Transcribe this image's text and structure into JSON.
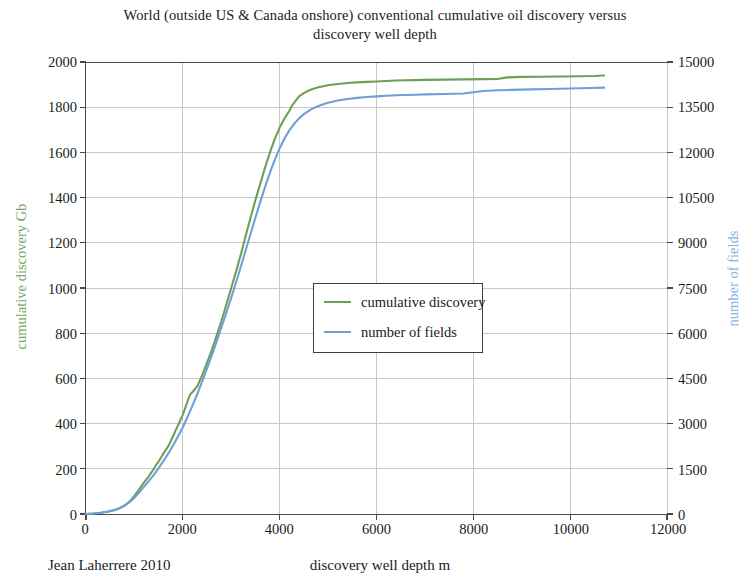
{
  "chart_data": {
    "type": "line",
    "title": "World (outside US & Canada onshore) conventional cumulative oil discovery versus discovery well depth",
    "title_line1": "World (outside US & Canada onshore) conventional cumulative oil discovery versus",
    "title_line2": "discovery well depth",
    "xlabel": "discovery well depth m",
    "ylabel": "cumulative discovery Gb",
    "ylabel_right": "number of fields",
    "credit": "Jean Laherrere 2010",
    "xlim": [
      0,
      12000
    ],
    "ylim": [
      0,
      2000
    ],
    "ylim_right": [
      0,
      15000
    ],
    "xticks": [
      0,
      2000,
      4000,
      6000,
      8000,
      10000,
      12000
    ],
    "yticks": [
      0,
      200,
      400,
      600,
      800,
      1000,
      1200,
      1400,
      1600,
      1800,
      2000
    ],
    "yticks_right": [
      0,
      1500,
      3000,
      4500,
      6000,
      7500,
      9000,
      10500,
      12000,
      13500,
      15000
    ],
    "grid": true,
    "legend_position": "center",
    "colors": {
      "cumulative_discovery": "#6f9e55",
      "number_of_fields": "#6f9fd8"
    },
    "series": [
      {
        "name": "cumulative discovery",
        "color": "#6f9e55",
        "axis": "left",
        "unit": "Gb",
        "x": [
          0,
          150,
          300,
          450,
          600,
          700,
          800,
          900,
          1000,
          1100,
          1200,
          1300,
          1400,
          1450,
          1500,
          1600,
          1650,
          1700,
          1800,
          1850,
          1900,
          2000,
          2100,
          2150,
          2200,
          2300,
          2400,
          2500,
          2600,
          2700,
          2800,
          2900,
          3000,
          3100,
          3200,
          3300,
          3400,
          3500,
          3600,
          3700,
          3800,
          3900,
          4000,
          4100,
          4200,
          4250,
          4300,
          4400,
          4500,
          4600,
          4700,
          4800,
          4900,
          5000,
          5200,
          5400,
          5600,
          5800,
          6000,
          6200,
          6400,
          6600,
          6800,
          7000,
          7400,
          7800,
          8200,
          8500,
          8700,
          9000,
          9400,
          9800,
          10200,
          10500,
          10700
        ],
        "y": [
          0,
          2,
          5,
          10,
          18,
          26,
          38,
          55,
          80,
          110,
          140,
          168,
          200,
          218,
          232,
          268,
          285,
          300,
          345,
          370,
          392,
          440,
          500,
          528,
          540,
          566,
          614,
          670,
          726,
          790,
          856,
          928,
          1000,
          1074,
          1150,
          1232,
          1312,
          1390,
          1462,
          1534,
          1600,
          1660,
          1710,
          1750,
          1784,
          1806,
          1820,
          1848,
          1862,
          1874,
          1882,
          1888,
          1893,
          1897,
          1903,
          1907,
          1910,
          1912,
          1914,
          1916,
          1918,
          1919,
          1920,
          1921,
          1922,
          1923,
          1924,
          1925,
          1932,
          1934,
          1935,
          1936,
          1937,
          1938,
          1940
        ]
      },
      {
        "name": "number of fields",
        "color": "#6f9fd8",
        "axis": "right",
        "unit": "fields",
        "x": [
          0,
          150,
          300,
          450,
          600,
          700,
          800,
          900,
          1000,
          1100,
          1200,
          1300,
          1400,
          1500,
          1600,
          1700,
          1800,
          1900,
          2000,
          2100,
          2200,
          2300,
          2400,
          2500,
          2600,
          2700,
          2800,
          2900,
          3000,
          3100,
          3200,
          3300,
          3400,
          3500,
          3600,
          3700,
          3800,
          3900,
          4000,
          4100,
          4200,
          4300,
          4400,
          4500,
          4600,
          4700,
          4800,
          4900,
          5000,
          5200,
          5400,
          5600,
          5800,
          6000,
          6200,
          6400,
          6600,
          6800,
          7000,
          7400,
          7800,
          8200,
          8500,
          8800,
          9200,
          9600,
          10000,
          10400,
          10700
        ],
        "y": [
          0,
          15,
          40,
          80,
          140,
          200,
          280,
          390,
          540,
          720,
          910,
          1100,
          1300,
          1520,
          1760,
          2010,
          2280,
          2570,
          2880,
          3230,
          3600,
          3990,
          4400,
          4830,
          5280,
          5740,
          6210,
          6690,
          7180,
          7690,
          8220,
          8760,
          9300,
          9840,
          10360,
          10860,
          11330,
          11760,
          12140,
          12460,
          12730,
          12950,
          13130,
          13270,
          13380,
          13470,
          13540,
          13600,
          13650,
          13720,
          13770,
          13810,
          13840,
          13860,
          13880,
          13895,
          13905,
          13915,
          13925,
          13940,
          13955,
          14040,
          14060,
          14075,
          14090,
          14105,
          14120,
          14135,
          14150
        ]
      }
    ]
  },
  "axes": {
    "left_tick_labels": [
      "2000",
      "1800",
      "1600",
      "1400",
      "1200",
      "1000",
      "800",
      "600",
      "400",
      "200",
      "0"
    ],
    "right_tick_labels": [
      "15000",
      "13500",
      "12000",
      "10500",
      "9000",
      "7500",
      "6000",
      "4500",
      "3000",
      "1500",
      "0"
    ],
    "x_tick_labels": [
      "0",
      "2000",
      "4000",
      "6000",
      "8000",
      "10000",
      "12000"
    ]
  },
  "legend": {
    "entries": [
      {
        "label": "cumulative discovery",
        "color": "#6f9e55"
      },
      {
        "label": "number of fields",
        "color": "#6f9fd8"
      }
    ]
  }
}
